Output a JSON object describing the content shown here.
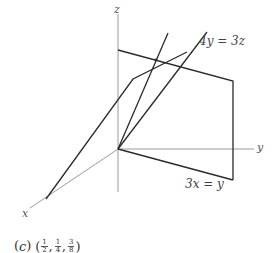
{
  "figure": {
    "axes": {
      "x_label": "x",
      "y_label": "y",
      "z_label": "z",
      "origin": [
        118,
        149
      ]
    },
    "planes": [
      {
        "label": "4y = 3z",
        "edges": [
          [
            [
              118,
              50
            ],
            [
              233,
              81
            ]
          ],
          [
            [
              233,
              81
            ],
            [
              233,
              180
            ]
          ]
        ]
      },
      {
        "label": "3x = y",
        "edges": [
          [
            [
              118,
              149
            ],
            [
              233,
              180
            ]
          ]
        ]
      }
    ],
    "lines": [
      {
        "points": [
          [
            46,
            199
          ],
          [
            133,
            79
          ],
          [
            187,
            52
          ]
        ]
      },
      {
        "points": [
          [
            118,
            149
          ],
          [
            207,
            32
          ]
        ]
      },
      {
        "points": [
          [
            118,
            149
          ],
          [
            168,
            33
          ]
        ]
      }
    ],
    "intersection_point": [
      156,
      60
    ],
    "colors": {
      "axis": "#9a9a9a",
      "edge": "#2a2a2a",
      "text": "#444444"
    }
  },
  "labels": {
    "plane_top": "4y = 3z",
    "plane_bottom": "3x = y",
    "z": "z",
    "y": "y",
    "x": "x"
  },
  "caption": {
    "part": "c",
    "point": {
      "x": {
        "num": "1",
        "den": "2"
      },
      "y": {
        "num": "1",
        "den": "4"
      },
      "z": {
        "num": "3",
        "den": "8"
      }
    },
    "text": "(c) (1/2, 1/4, 3/8)"
  }
}
